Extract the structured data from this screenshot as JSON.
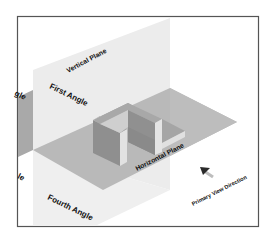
{
  "diagram": {
    "type": "projection-angles-isometric",
    "labels": {
      "vertical_plane": "Vertical Plane",
      "first_angle": "First Angle",
      "second_angle_fragment": "gle",
      "third_angle_fragment": "le",
      "fourth_angle": "Fourth Angle",
      "horizontal_plane": "Horizontal Plane",
      "primary_view_direction": "Primary View Direction"
    },
    "icons": {
      "view_arrow": "arrow-up-left-icon"
    },
    "colors": {
      "frame": "#555555",
      "vertical_plane": "#ececec",
      "horizontal_plane": "#b9b9b9",
      "hidden_plane": "#a9a9a9",
      "object_dark": "#8f8f8f",
      "object_mid": "#a3a3a3",
      "object_light": "#e2e2e2",
      "text": "#111111"
    }
  }
}
